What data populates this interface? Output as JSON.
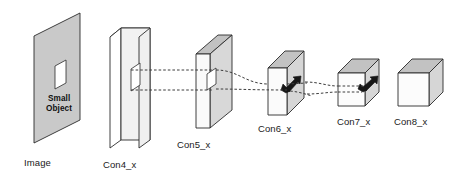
{
  "figure": {
    "background_color": "#ffffff",
    "line_color": "#2b2b2b",
    "face_colors": {
      "image_plane": "#c9c9c9",
      "front_light": "#f4f4f4",
      "front_white": "#ffffff",
      "top_gray": "#c4c4c4",
      "side_gray": "#dcdcdc",
      "arrow_dark": "#1a1a1a"
    }
  },
  "labels": {
    "image": "Image",
    "small_object_line1": "Small",
    "small_object_line2": "Object",
    "conv4": "Con4_x",
    "conv5": "Con5_x",
    "conv6": "Con6_x",
    "conv7": "Con7_x",
    "conv8": "Con8_x"
  },
  "stages": [
    {
      "id": "image",
      "label": "Image",
      "kind": "plane",
      "has_object_window": true,
      "has_arrow": false,
      "label_x": 24,
      "label_y": 165
    },
    {
      "id": "conv4",
      "label": "Con4_x",
      "kind": "slab",
      "has_object_window": true,
      "has_arrow": false,
      "label_x": 103,
      "label_y": 167
    },
    {
      "id": "conv5",
      "label": "Con5_x",
      "kind": "slab",
      "has_object_window": true,
      "has_arrow": false,
      "label_x": 178,
      "label_y": 147
    },
    {
      "id": "conv6",
      "label": "Con6_x",
      "kind": "box",
      "has_object_window": false,
      "has_arrow": true,
      "label_x": 259,
      "label_y": 131
    },
    {
      "id": "conv7",
      "label": "Con7_x",
      "kind": "cube",
      "has_object_window": false,
      "has_arrow": true,
      "label_x": 337,
      "label_y": 124
    },
    {
      "id": "conv8",
      "label": "Con8_x",
      "kind": "cube",
      "has_object_window": false,
      "has_arrow": false,
      "label_x": 395,
      "label_y": 124
    }
  ],
  "connections": [
    {
      "from": "conv4",
      "to": "conv5",
      "style": "dashed",
      "lines": 2
    },
    {
      "from": "conv5",
      "to": "conv6",
      "style": "dashed-curved",
      "lines": 2
    },
    {
      "from": "conv6",
      "to": "conv7",
      "style": "dashed-curved",
      "lines": 2
    }
  ]
}
